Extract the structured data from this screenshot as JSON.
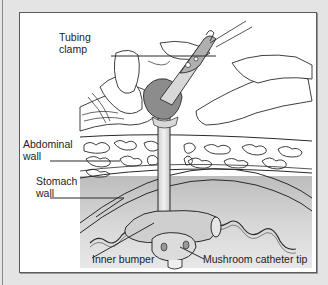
{
  "figure": {
    "type": "anatomical illustration",
    "labels": {
      "tubing_clamp_line1": "Tubing",
      "tubing_clamp_line2": "clamp",
      "abdominal_wall_line1": "Abdominal",
      "abdominal_wall_line2": "wall",
      "stomach_wall_line1": "Stomach",
      "stomach_wall_line2": "wall",
      "inner_bumper": "Inner bumper",
      "mushroom_catheter_tip": "Mushroom catheter tip"
    }
  },
  "colors": {
    "page_background": "#e4e4e4",
    "panel_background": "#ffffff",
    "panel_border": "#5a5a5a",
    "stomach_gray": "#cfcfcf",
    "stomach_dark": "#a8a8a8",
    "stoma_dark": "#8c8c8c",
    "line": "#2a2a2a"
  }
}
